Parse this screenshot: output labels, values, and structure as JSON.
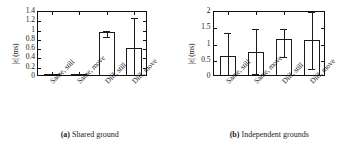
{
  "figure": {
    "panels": [
      {
        "caption_tag": "(a)",
        "caption_text": "Shared ground",
        "chart_data": {
          "type": "bar",
          "title": "",
          "subtitle": "",
          "xlabel": "",
          "ylabel": "|ε| (ms)",
          "categories": [
            "Same, still",
            "Same, move",
            "Diff, still",
            "Diff, move"
          ],
          "values": [
            0.03,
            0.02,
            0.93,
            0.58
          ],
          "error_low": [
            0.0,
            0.0,
            0.87,
            0.05
          ],
          "error_high": [
            0.06,
            0.05,
            0.99,
            1.27
          ],
          "ylim": [
            0,
            1.4
          ],
          "yticks": [
            0,
            0.2,
            0.4,
            0.6,
            0.8,
            1,
            1.2,
            1.4
          ],
          "ytick_labels": [
            "0",
            "0.2",
            "0.4",
            "0.6",
            "0.8",
            "1",
            "1.2",
            "1.4"
          ],
          "grid": false,
          "legend": false,
          "legend_position": "none",
          "bar_fill": "#ffffff",
          "bar_edge": "#1a1a1a"
        }
      },
      {
        "caption_tag": "(b)",
        "caption_text": "Independent grounds",
        "chart_data": {
          "type": "bar",
          "title": "",
          "subtitle": "",
          "xlabel": "",
          "ylabel": "|ε| (ms)",
          "categories": [
            "Same, still",
            "Same, move",
            "Diff, still",
            "Diff, move"
          ],
          "values": [
            0.59,
            0.71,
            1.12,
            1.07
          ],
          "error_low": [
            0.05,
            0.1,
            0.62,
            0.26
          ],
          "error_high": [
            1.34,
            1.48,
            1.47,
            2.0
          ],
          "ylim": [
            0,
            2
          ],
          "yticks": [
            0,
            0.5,
            1,
            1.5,
            2
          ],
          "ytick_labels": [
            "0",
            "0.5",
            "1",
            "1.5",
            "2"
          ],
          "grid": false,
          "legend": false,
          "legend_position": "none",
          "bar_fill": "#ffffff",
          "bar_edge": "#1a1a1a"
        }
      }
    ]
  }
}
